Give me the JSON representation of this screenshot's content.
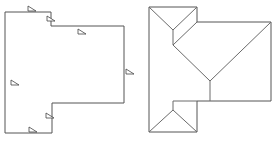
{
  "diagram": {
    "type": "roof-plan",
    "colors": {
      "line": "#555555",
      "background": "#ffffff"
    },
    "footprint_plan": {
      "label": "footprint-with-pitch-markers",
      "outline": [
        [
          5,
          12
        ],
        [
          51,
          12
        ],
        [
          51,
          26
        ],
        [
          124,
          26
        ],
        [
          124,
          103
        ],
        [
          52,
          103
        ],
        [
          52,
          133
        ],
        [
          5,
          133
        ],
        [
          5,
          12
        ]
      ],
      "pitch_markers": [
        {
          "x": 28,
          "y": 9
        },
        {
          "x": 47,
          "y": 19
        },
        {
          "x": 78,
          "y": 32
        },
        {
          "x": 126,
          "y": 72
        },
        {
          "x": 11,
          "y": 83
        },
        {
          "x": 46,
          "y": 116
        },
        {
          "x": 29,
          "y": 130
        }
      ]
    },
    "roof_plan": {
      "label": "hip-roof-plan",
      "outline": [
        [
          149,
          7
        ],
        [
          197,
          7
        ],
        [
          197,
          22
        ],
        [
          271,
          22
        ],
        [
          271,
          101
        ],
        [
          197,
          101
        ],
        [
          197,
          132
        ],
        [
          149,
          132
        ],
        [
          149,
          7
        ]
      ],
      "ridges_and_hips": [
        [
          [
            149,
            7
          ],
          [
            173,
            30
          ]
        ],
        [
          [
            197,
            7
          ],
          [
            173,
            30
          ]
        ],
        [
          [
            173,
            30
          ],
          [
            173,
            45
          ]
        ],
        [
          [
            197,
            22
          ],
          [
            173,
            45
          ]
        ],
        [
          [
            173,
            45
          ],
          [
            210,
            81
          ]
        ],
        [
          [
            271,
            22
          ],
          [
            210,
            81
          ]
        ],
        [
          [
            210,
            81
          ],
          [
            210,
            101
          ]
        ],
        [
          [
            173,
            101
          ],
          [
            197,
            101
          ]
        ],
        [
          [
            173,
            101
          ],
          [
            173,
            110
          ]
        ],
        [
          [
            173,
            110
          ],
          [
            149,
            132
          ]
        ],
        [
          [
            173,
            110
          ],
          [
            197,
            132
          ]
        ]
      ]
    }
  }
}
